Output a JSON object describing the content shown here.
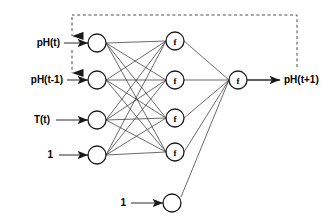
{
  "diagram": {
    "colors": {
      "stroke": "#1a1a1a",
      "background": "#ffffff",
      "feedback": "#4d4d4d"
    },
    "input_labels": [
      {
        "text": "pH(t)",
        "x": 60,
        "y": 43
      },
      {
        "text": "pH(t-1)",
        "x": 63,
        "y": 80
      },
      {
        "text": "T(t)",
        "x": 50,
        "y": 120
      },
      {
        "text": "1",
        "x": 53,
        "y": 155
      }
    ],
    "bias_label": {
      "text": "1",
      "x": 126,
      "y": 203
    },
    "output_label": {
      "text": "pH(t+1)",
      "x": 284,
      "y": 80
    },
    "input_nodes": [
      {
        "name": "input-node-ph-t",
        "cx": 97,
        "cy": 43,
        "r": 9,
        "label": ""
      },
      {
        "name": "input-node-ph-t-1",
        "cx": 97,
        "cy": 80,
        "r": 9,
        "label": ""
      },
      {
        "name": "input-node-temp-t",
        "cx": 97,
        "cy": 120,
        "r": 9,
        "label": ""
      },
      {
        "name": "input-node-bias",
        "cx": 97,
        "cy": 155,
        "r": 9,
        "label": ""
      }
    ],
    "hidden_nodes": [
      {
        "name": "hidden-node-1",
        "cx": 175,
        "cy": 41,
        "r": 9,
        "label": "f"
      },
      {
        "name": "hidden-node-2",
        "cx": 175,
        "cy": 80,
        "r": 9,
        "label": "f"
      },
      {
        "name": "hidden-node-3",
        "cx": 175,
        "cy": 118,
        "r": 9,
        "label": "f"
      },
      {
        "name": "hidden-node-4",
        "cx": 175,
        "cy": 152,
        "r": 9,
        "label": "f"
      }
    ],
    "output_bias_node": {
      "name": "output-bias-node",
      "cx": 172,
      "cy": 203,
      "r": 9,
      "label": ""
    },
    "output_node": {
      "name": "output-node",
      "cx": 238,
      "cy": 80,
      "r": 9,
      "label": "f"
    },
    "feedback_path": {
      "name": "feedback-connection",
      "description": "dashed recurrent feedback from output to pH(t) and pH(t-1) inputs",
      "top_y": 15,
      "right_x": 297,
      "down_y": 67,
      "left_x": 72,
      "arrow1_y": 45,
      "arrow2_y": 82
    },
    "layer_count": 3,
    "connection_style": "fully-connected"
  }
}
